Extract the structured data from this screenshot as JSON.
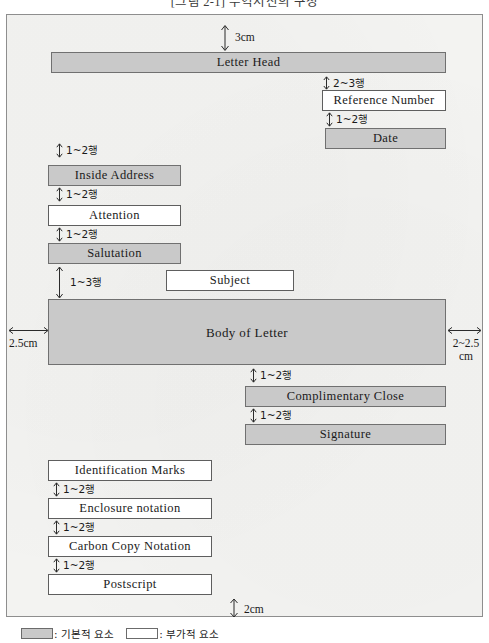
{
  "figure": {
    "title": "[그림 2-1] 무역서신의 구성",
    "caption_clipped": true
  },
  "legend": {
    "primary_swatch_label": ": 기본적 요소",
    "optional_swatch_label": ": 부가적 요소"
  },
  "margins": {
    "top": "3cm",
    "left": "2.5cm",
    "right_line1": "2~2.5",
    "right_line2": "cm",
    "bottom": "2cm"
  },
  "gaps": {
    "ref_from_letterhead": "2~3행",
    "date_from_ref": "1~2행",
    "inside_address": "1~2행",
    "attention": "1~2행",
    "salutation": "1~2행",
    "body_from_salutation": "1~3행",
    "complimentary_close": "1~2행",
    "signature": "1~2행",
    "enclosure": "1~2행",
    "carbon_copy": "1~2행",
    "postscript": "1~2행"
  },
  "elements": {
    "letter_head": "Letter Head",
    "reference_number": "Reference Number",
    "date": "Date",
    "inside_address": "Inside Address",
    "attention": "Attention",
    "salutation": "Salutation",
    "subject": "Subject",
    "body_of_letter": "Body of Letter",
    "complimentary_close": "Complimentary Close",
    "signature": "Signature",
    "identification_marks": "Identification Marks",
    "enclosure_notation": "Enclosure notation",
    "carbon_copy_notation": "Carbon Copy Notation",
    "postscript": "Postscript"
  },
  "colors": {
    "primary_fill": "#c9c9c9",
    "optional_fill": "#ffffff",
    "page_fill": "#f3f3f1",
    "stroke": "#6b6b6b"
  }
}
